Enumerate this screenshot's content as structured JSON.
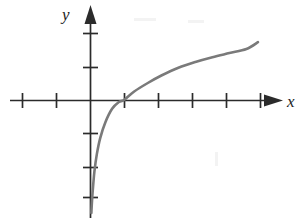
{
  "figure": {
    "background_color": "#ffffff",
    "width": 301,
    "height": 223
  },
  "axes": {
    "x_label": "x",
    "y_label": "y",
    "axis_color": "#2b2b2b",
    "origin_px": [
      90,
      100
    ],
    "unit_px": 34,
    "x_axis": {
      "start_px": 10,
      "end_px": 282,
      "y_px": 100,
      "has_arrow": true,
      "arrow_direction": "right",
      "tick_positions_px": [
        22,
        56,
        124,
        158,
        192,
        226,
        260
      ],
      "tick_values": [
        -2,
        -1,
        1,
        2,
        3,
        4,
        5
      ],
      "tick_half_length_px": 7
    },
    "y_axis": {
      "start_px": 218,
      "end_px": 5,
      "x_px": 90,
      "has_arrow": true,
      "arrow_direction": "up",
      "tick_positions_px": [
        33,
        67,
        133,
        167,
        197
      ],
      "tick_values": [
        2,
        1,
        -1,
        -2,
        -3
      ],
      "tick_half_length_px": 7
    }
  },
  "chart_data": {
    "type": "line",
    "xlabel": "x",
    "ylabel": "y",
    "grid": false,
    "legend": "none",
    "xlim": [
      -2.35,
      5.65
    ],
    "ylim": [
      -3.47,
      2.79
    ],
    "xticks": [
      -2,
      -1,
      1,
      2,
      3,
      4,
      5
    ],
    "yticks": [
      -3,
      -2,
      -1,
      1,
      2
    ],
    "series": [
      {
        "name": "y = log(x)",
        "color": "#7a7a7a",
        "line_width_px": 2.6,
        "x": [
          0.04,
          0.06,
          0.09,
          0.13,
          0.2,
          0.3,
          0.45,
          0.65,
          0.85,
          1.0,
          1.3,
          1.7,
          2.1,
          2.6,
          3.1,
          3.6,
          4.1,
          4.6,
          4.94
        ],
        "y": [
          -3.32,
          -2.95,
          -2.55,
          -2.1,
          -1.6,
          -1.12,
          -0.66,
          -0.26,
          -0.06,
          0.0,
          0.25,
          0.5,
          0.72,
          0.95,
          1.12,
          1.26,
          1.38,
          1.5,
          1.7
        ],
        "x_px": [
          57,
          58,
          60,
          62,
          97,
          100,
          105,
          112,
          119,
          124,
          135,
          148,
          162,
          179,
          196,
          213,
          230,
          247,
          258
        ],
        "y_px": [
          213,
          195,
          178,
          162,
          154,
          138,
          122,
          109,
          102,
          100,
          91,
          83,
          76,
          68,
          62,
          57,
          53,
          49,
          42
        ],
        "start_point_px": [
          57,
          213
        ],
        "end_point_px": [
          258,
          42
        ],
        "passes_through_origin": true,
        "vertical_asymptote_x": 0
      }
    ]
  }
}
